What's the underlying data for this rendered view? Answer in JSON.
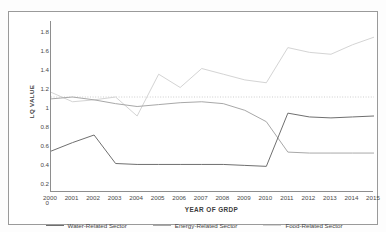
{
  "figure": {
    "top_caption": "",
    "y_axis_title": "LQ VALUE",
    "x_axis_title": "YEAR OF GRDP"
  },
  "chart_data": {
    "type": "line",
    "title": "",
    "subtitle": "",
    "xlabel": "YEAR OF GRDP",
    "ylabel": "LQ VALUE",
    "xlim": [
      2000,
      2015
    ],
    "ylim": [
      0,
      1.8
    ],
    "ytick_labels": [
      "1.8",
      "1.6",
      "1.4",
      "1.2",
      "1",
      "0.8",
      "0.6",
      "0.4",
      "0.2",
      "0"
    ],
    "ytick_values": [
      1.8,
      1.6,
      1.4,
      1.2,
      1.0,
      0.8,
      0.6,
      0.4,
      0.2,
      0.0
    ],
    "grid": false,
    "reference_line": {
      "value": 1.0,
      "style": "dotted",
      "color": "#b9b9b9"
    },
    "legend_position": "bottom",
    "categories": [
      2000,
      2001,
      2002,
      2003,
      2004,
      2005,
      2006,
      2007,
      2008,
      2009,
      2010,
      2011,
      2012,
      2013,
      2014,
      2015
    ],
    "series": [
      {
        "name": "Water-Related Sector",
        "color": "#6f6f6f",
        "values": [
          0.43,
          0.52,
          0.6,
          0.3,
          0.29,
          0.29,
          0.29,
          0.29,
          0.29,
          0.28,
          0.27,
          0.83,
          0.79,
          0.78,
          0.79,
          0.8
        ]
      },
      {
        "name": "Energy-Related Sector",
        "color": "#a8a8a8",
        "values": [
          0.98,
          1.0,
          0.97,
          0.93,
          0.9,
          0.92,
          0.94,
          0.95,
          0.93,
          0.86,
          0.74,
          0.42,
          0.41,
          0.41,
          0.41,
          0.41
        ]
      },
      {
        "name": "Food-Related Sector",
        "color": "#d4d4d4",
        "values": [
          1.05,
          0.95,
          0.97,
          1.0,
          0.8,
          1.24,
          1.1,
          1.3,
          1.24,
          1.18,
          1.15,
          1.52,
          1.47,
          1.45,
          1.55,
          1.63
        ]
      }
    ]
  },
  "legend": {
    "entries": [
      {
        "label": "Water-Related Sector",
        "color": "#6f6f6f"
      },
      {
        "label": "Energy-Related Sector",
        "color": "#a8a8a8"
      },
      {
        "label": "Food-Related Sector",
        "color": "#d4d4d4"
      }
    ]
  }
}
